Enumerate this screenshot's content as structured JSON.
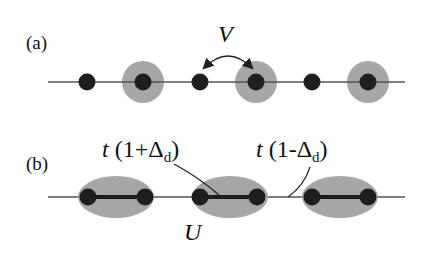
{
  "colors": {
    "line": "#555555",
    "site": "#1e1e1e",
    "halo": "#a6a6a6",
    "bond": "#1e1e1e",
    "text": "#111111"
  },
  "panel_a": {
    "label": "(a)",
    "interaction_label": "V",
    "line": {
      "x1": 48,
      "x2": 405,
      "y": 82
    },
    "sites": [
      {
        "x": 87,
        "occupied": false
      },
      {
        "x": 143,
        "occupied": true
      },
      {
        "x": 200,
        "occupied": false
      },
      {
        "x": 256,
        "occupied": true
      },
      {
        "x": 312,
        "occupied": false
      },
      {
        "x": 368,
        "occupied": true
      }
    ]
  },
  "panel_b": {
    "label": "(b)",
    "strong_bond_label": {
      "t": "t",
      "open": " (1+Δ",
      "sub": "d",
      "close": ")"
    },
    "weak_bond_label": {
      "t": "t",
      "open": " (1-Δ",
      "sub": "d",
      "close": ")"
    },
    "onsite_label": "U",
    "line": {
      "x1": 48,
      "x2": 405,
      "y": 197
    },
    "dimers": [
      {
        "cx": 116,
        "left": 88,
        "right": 145
      },
      {
        "cx": 230,
        "left": 200,
        "right": 257
      },
      {
        "cx": 340,
        "left": 312,
        "right": 368
      }
    ]
  }
}
